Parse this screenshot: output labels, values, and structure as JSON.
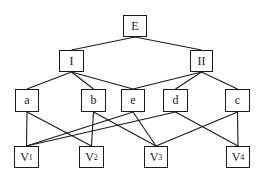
{
  "diagram": {
    "title": "",
    "nodes": [
      {
        "id": "E",
        "label": "E",
        "sub": "",
        "x": 123,
        "y": 15,
        "w": 24,
        "h": 22
      },
      {
        "id": "I",
        "label": "I",
        "sub": "",
        "x": 59,
        "y": 50,
        "w": 25,
        "h": 22
      },
      {
        "id": "II",
        "label": "II",
        "sub": "",
        "x": 190,
        "y": 50,
        "w": 23,
        "h": 22
      },
      {
        "id": "a",
        "label": "a",
        "sub": "",
        "x": 15,
        "y": 89,
        "w": 24,
        "h": 23
      },
      {
        "id": "b",
        "label": "b",
        "sub": "",
        "x": 81,
        "y": 89,
        "w": 25,
        "h": 23
      },
      {
        "id": "e",
        "label": "e",
        "sub": "",
        "x": 121,
        "y": 89,
        "w": 24,
        "h": 23
      },
      {
        "id": "d",
        "label": "d",
        "sub": "",
        "x": 163,
        "y": 89,
        "w": 25,
        "h": 23
      },
      {
        "id": "c",
        "label": "c",
        "sub": "",
        "x": 225,
        "y": 89,
        "w": 25,
        "h": 23
      },
      {
        "id": "V1",
        "label": "V",
        "sub": "1",
        "x": 14,
        "y": 146,
        "w": 25,
        "h": 22
      },
      {
        "id": "V2",
        "label": "V",
        "sub": "2",
        "x": 79,
        "y": 146,
        "w": 25,
        "h": 22
      },
      {
        "id": "V3",
        "label": "V",
        "sub": "3",
        "x": 144,
        "y": 146,
        "w": 24,
        "h": 22
      },
      {
        "id": "V4",
        "label": "V",
        "sub": "4",
        "x": 226,
        "y": 146,
        "w": 24,
        "h": 22
      }
    ],
    "edges": [
      [
        "E",
        "I"
      ],
      [
        "E",
        "II"
      ],
      [
        "I",
        "a"
      ],
      [
        "I",
        "b"
      ],
      [
        "I",
        "e"
      ],
      [
        "II",
        "e"
      ],
      [
        "II",
        "d"
      ],
      [
        "II",
        "c"
      ],
      [
        "a",
        "V1"
      ],
      [
        "a",
        "V2"
      ],
      [
        "b",
        "V2"
      ],
      [
        "b",
        "V3"
      ],
      [
        "e",
        "V1"
      ],
      [
        "e",
        "V3"
      ],
      [
        "d",
        "V1"
      ],
      [
        "d",
        "V4"
      ],
      [
        "c",
        "V3"
      ],
      [
        "c",
        "V4"
      ]
    ],
    "colors": {
      "stroke": "#1a1a1a",
      "background": "#ffffff"
    }
  }
}
